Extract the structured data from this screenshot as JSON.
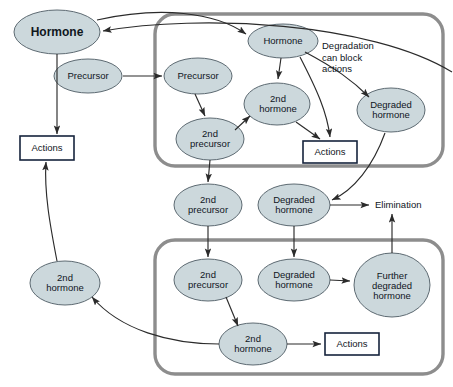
{
  "diagram": {
    "colors": {
      "ellipse_fill": "#ccd8dc",
      "ellipse_stroke": "#5d6a72",
      "box_stroke": "#16243c",
      "box_fill": "#ffffff",
      "container_stroke": "#8d8d8d",
      "arrow_stroke": "#2b2b2b",
      "text": "#10161c",
      "background": "#ffffff"
    },
    "nodes": [
      {
        "id": "hormone_outer",
        "label": "Hormone",
        "shape": "ellipse",
        "style": "bold",
        "cx": 57,
        "cy": 32,
        "rx": 43,
        "ry": 22
      },
      {
        "id": "precursor_outer",
        "label": "Precursor",
        "shape": "ellipse",
        "style": "plain",
        "cx": 88,
        "cy": 76,
        "rx": 34,
        "ry": 17
      },
      {
        "id": "actions_outer",
        "label": "Actions",
        "shape": "box",
        "style": "plain",
        "cx": 47,
        "cy": 148,
        "w": 54,
        "h": 24
      },
      {
        "id": "hormone_2nd_outer",
        "label": "2nd\nhormone",
        "shape": "ellipse",
        "style": "plain",
        "cx": 65,
        "cy": 283,
        "rx": 35,
        "ry": 22
      },
      {
        "id": "hormone_inner",
        "label": "Hormone",
        "shape": "ellipse",
        "style": "plain",
        "cx": 283,
        "cy": 41,
        "rx": 35,
        "ry": 17
      },
      {
        "id": "precursor_inner",
        "label": "Precursor",
        "shape": "ellipse",
        "style": "plain",
        "cx": 198,
        "cy": 76,
        "rx": 34,
        "ry": 18
      },
      {
        "id": "precursor_2nd_inner",
        "label": "2nd\nprecursor",
        "shape": "ellipse",
        "style": "plain",
        "cx": 210,
        "cy": 139,
        "rx": 34,
        "ry": 21
      },
      {
        "id": "hormone_2nd_inner",
        "label": "2nd\nhormone",
        "shape": "ellipse",
        "style": "plain",
        "cx": 277,
        "cy": 104,
        "rx": 33,
        "ry": 21
      },
      {
        "id": "degraded_inner",
        "label": "Degraded\nhormone",
        "shape": "ellipse",
        "style": "plain",
        "cx": 391,
        "cy": 110,
        "rx": 34,
        "ry": 22
      },
      {
        "id": "actions_inner",
        "label": "Actions",
        "shape": "box",
        "style": "plain",
        "cx": 330,
        "cy": 152,
        "w": 54,
        "h": 22
      },
      {
        "id": "precursor_2nd_mid",
        "label": "2nd\nprecursor",
        "shape": "ellipse",
        "style": "plain",
        "cx": 208,
        "cy": 205,
        "rx": 34,
        "ry": 21
      },
      {
        "id": "degraded_mid",
        "label": "Degraded\nhormone",
        "shape": "ellipse",
        "style": "plain",
        "cx": 294,
        "cy": 205,
        "rx": 36,
        "ry": 21
      },
      {
        "id": "precursor_2nd_bot",
        "label": "2nd\nprecursor",
        "shape": "ellipse",
        "style": "plain",
        "cx": 208,
        "cy": 280,
        "rx": 34,
        "ry": 21
      },
      {
        "id": "degraded_bot",
        "label": "Degraded\nhormone",
        "shape": "ellipse",
        "style": "plain",
        "cx": 294,
        "cy": 280,
        "rx": 36,
        "ry": 21
      },
      {
        "id": "further_degraded_bot",
        "label": "Further\ndegraded\nhormone",
        "shape": "ellipse",
        "style": "plain",
        "cx": 392,
        "cy": 285,
        "rx": 38,
        "ry": 32
      },
      {
        "id": "hormone_2nd_bot",
        "label": "2nd\nhormone",
        "shape": "ellipse",
        "style": "plain",
        "cx": 253,
        "cy": 344,
        "rx": 34,
        "ry": 21
      },
      {
        "id": "actions_bot",
        "label": "Actions",
        "shape": "box",
        "style": "plain",
        "cx": 352,
        "cy": 344,
        "w": 54,
        "h": 22
      }
    ],
    "annotations": [
      {
        "id": "degradation_note",
        "text": "Degradation\ncan block\nactions",
        "x": 322,
        "y": 44,
        "align": "left"
      },
      {
        "id": "elimination_label",
        "text": "Elimination",
        "x": 375,
        "y": 206,
        "align": "left"
      }
    ],
    "containers": [
      {
        "id": "inner-compartment-top",
        "x": 155,
        "y": 14,
        "w": 288,
        "h": 152
      },
      {
        "id": "inner-compartment-bottom",
        "x": 155,
        "y": 240,
        "w": 288,
        "h": 134
      }
    ],
    "edge_labels": {
      "precursor_to_precursor": "Precursor to inner Precursor",
      "hormone_feedback": "Inner compartment back to Hormone"
    }
  }
}
